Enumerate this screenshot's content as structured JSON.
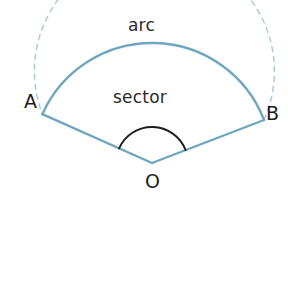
{
  "figure": {
    "background_color": "#ffffff"
  },
  "labels": {
    "arc": "arc",
    "sector": "sector",
    "point_a": "A",
    "point_b": "B",
    "center_o": "O"
  },
  "colors": {
    "sector_stroke": "#6fa6bf",
    "dashed_circle_stroke": "#9fc3d4",
    "angle_arc_stroke": "#1c1c1c",
    "text": "#2a2a2a"
  },
  "chart_data": {
    "type": "diagram",
    "subtype": "circle-sector",
    "center": {
      "label": "O",
      "x": 152,
      "y": 163
    },
    "radius": 120,
    "points": [
      {
        "label": "A",
        "x": 47,
        "y": 116,
        "angle_deg": 156
      },
      {
        "label": "B",
        "x": 258,
        "y": 122,
        "angle_deg": 21
      }
    ],
    "sector_arc": {
      "label": "arc",
      "from_point": "A",
      "to_point": "B",
      "sweep_deg": 135,
      "direction": "counterclockwise-over-top",
      "style": "solid",
      "color": "#6fa6bf"
    },
    "remaining_circle": {
      "style": "dashed",
      "sweep_deg": 225,
      "color": "#9fc3d4"
    },
    "radii": [
      {
        "from": "O",
        "to": "A",
        "style": "solid",
        "color": "#6fa6bf"
      },
      {
        "from": "O",
        "to": "B",
        "style": "solid",
        "color": "#6fa6bf"
      }
    ],
    "central_angle": {
      "vertex": "O",
      "between": [
        "A",
        "B"
      ],
      "marker_radius": 36,
      "style": "solid",
      "color": "#1c1c1c"
    },
    "annotations": [
      {
        "text": "arc",
        "x": 150,
        "y": 26,
        "describes": "sector_arc"
      },
      {
        "text": "sector",
        "x": 152,
        "y": 98,
        "describes": "sector_region"
      }
    ]
  }
}
